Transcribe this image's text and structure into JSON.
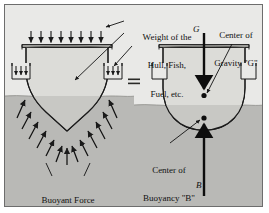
{
  "diagram": {
    "title_text": null,
    "operator": "=",
    "labels": {
      "weight": "Weight of the\nHull, Fish,\nFuel, etc.",
      "weight_line1": "Weight of the",
      "weight_line2": "Hull, Fish,",
      "weight_line3": "Fuel, etc.",
      "buoyant_force": "Buoyant Force\non Hull",
      "buoyant_force_line1": "Buoyant Force",
      "buoyant_force_line2": "on Hull",
      "center_of_gravity": "Center of\nGravity \"G\"",
      "center_of_gravity_line1": "Center of",
      "center_of_gravity_line2": "Gravity \"G\"",
      "center_of_buoyancy": "Center of\nBuoyancy \"B\"",
      "center_of_buoyancy_line1": "Center of",
      "center_of_buoyancy_line2": "Buoyancy \"B\"",
      "point_g": "G",
      "point_b": "B"
    },
    "colors": {
      "page_background": "#ffffff",
      "panel_background": "#e9e9e7",
      "water": "#b9b9b6",
      "hull_fill": "#dcdcd8",
      "hull_fill_submerged": "#c8c8c4",
      "stroke": "#1a1a1a",
      "frame_border": "#6d6d6d",
      "text": "#111111"
    },
    "left_figure": {
      "name": "hull-with-distributed-forces",
      "deck_load_arrow_count": 8,
      "side_arrow_count_left": 3,
      "side_arrow_count_right": 3,
      "buoyancy_arrow_count": 14,
      "hull_shape": "vee-bottom",
      "waterline_y": 96
    },
    "right_figure": {
      "name": "hull-with-resultant-forces",
      "hull_shape": "round-bottom",
      "waterline_y": 105,
      "gravity_vector": "down",
      "buoyancy_vector": "up"
    }
  }
}
